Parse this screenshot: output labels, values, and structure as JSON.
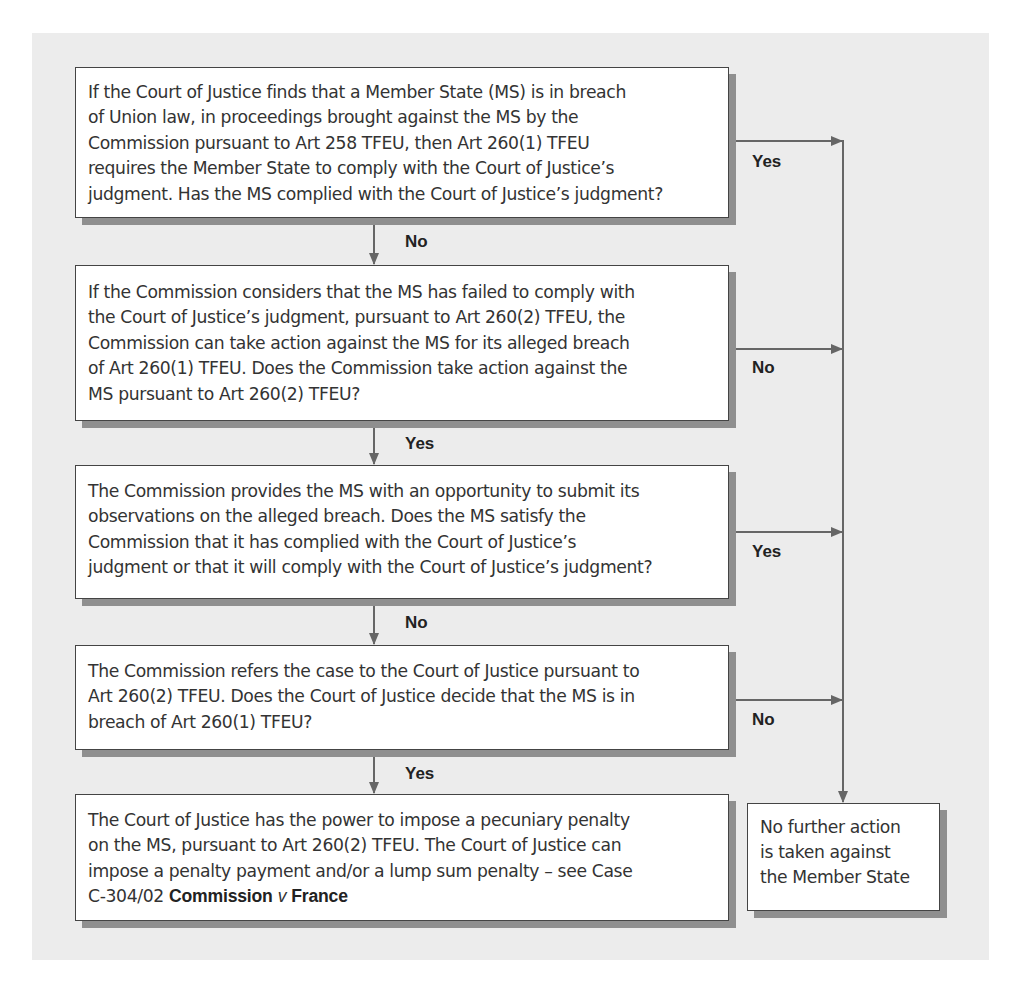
{
  "diagram": {
    "type": "flowchart",
    "boxes": [
      {
        "id": "step-1",
        "parts": [
          {
            "t": "If the "
          },
          {
            "t": "Court of Justice",
            "s": "cj"
          },
          {
            "t": " finds that a Member State (MS) is in breach of Union law, in proceedings brought against the MS by the Commission pursuant to Art 258 TFEU, then Art 260(1) TFEU requires the Member State to comply with the "
          },
          {
            "t": "Court of Justice",
            "s": "cj"
          },
          {
            "t": "’s judgment. Has the MS complied with the "
          },
          {
            "t": "Court of Justice",
            "s": "cj"
          },
          {
            "t": "’s judgment?"
          }
        ],
        "lines": [
          "If the Court of Justice finds that a Member State (MS) is in breach",
          "of Union law, in proceedings brought against the MS by the",
          "Commission pursuant to Art 258 TFEU, then Art 260(1) TFEU",
          "requires the Member State to comply with the Court of Justice’s",
          "judgment. Has the MS complied with the Court of Justice’s judgment?"
        ],
        "side_label": "Yes",
        "down_label": "No"
      },
      {
        "id": "step-2",
        "lines": [
          "If the Commission considers that the MS has failed to comply with",
          "the Court of Justice’s judgment, pursuant to Art 260(2) TFEU, the",
          "Commission can take action against the MS for its alleged breach",
          "of Art 260(1) TFEU. Does the Commission take action against the",
          "MS pursuant to Art 260(2) TFEU?"
        ],
        "side_label": "No",
        "down_label": "Yes"
      },
      {
        "id": "step-3",
        "lines": [
          "The Commission provides the MS with an opportunity to submit its",
          "observations on the alleged breach. Does the MS satisfy the",
          "Commission that it has complied with the Court of Justice’s",
          "judgment or that it will comply with the Court of Justice’s judgment?"
        ],
        "side_label": "Yes",
        "down_label": "No"
      },
      {
        "id": "step-4",
        "lines": [
          "The Commission refers the case to the Court of Justice pursuant to",
          "Art 260(2) TFEU. Does the Court of Justice decide that the MS is in",
          "breach of Art 260(1) TFEU?"
        ],
        "side_label": "No",
        "down_label": "Yes"
      },
      {
        "id": "step-5",
        "lines": [
          "The Court of Justice has the power to impose a pecuniary penalty",
          "on the MS, pursuant to Art 260(2) TFEU. The Court of Justice can",
          "impose a penalty payment and/or a lump sum penalty – see Case",
          "C-304/02 Commission v France"
        ],
        "case_reference": {
          "number": "C-304/02",
          "party_1": "Commission",
          "versus": "v",
          "party_2": "France"
        }
      }
    ],
    "terminal_box": {
      "id": "no-further-action",
      "lines": [
        "No further action",
        "is taken against",
        "the Member State"
      ]
    },
    "colors": {
      "panel_background": "#ececec",
      "box_background": "#ffffff",
      "box_border": "#444444",
      "box_shadow": "#8f8f8f",
      "connector": "#666666",
      "text": "#333333"
    }
  }
}
